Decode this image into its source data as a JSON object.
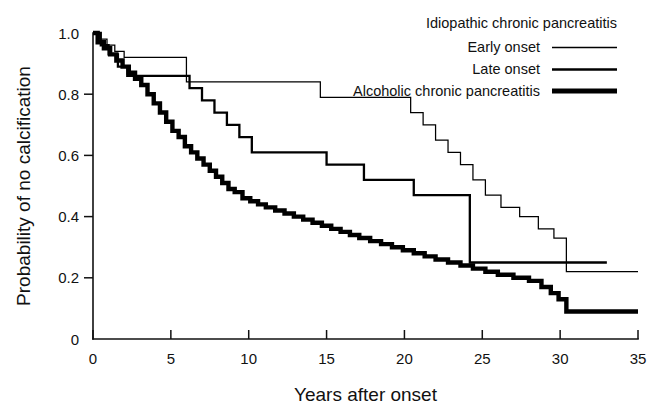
{
  "chart_data": {
    "type": "line",
    "title": "",
    "subtitle": "",
    "xlabel": "Years after onset",
    "ylabel": "Probability of no calcification",
    "xlim": [
      0,
      35
    ],
    "ylim": [
      0,
      1.0
    ],
    "xticks": [
      0,
      5,
      10,
      15,
      20,
      25,
      30,
      35
    ],
    "xticklabels": [
      "0",
      "5",
      "10",
      "15",
      "20",
      "25",
      "30",
      "35"
    ],
    "yticks": [
      0,
      0.2,
      0.4,
      0.6,
      0.8,
      1.0
    ],
    "yticklabels": [
      "0",
      "0.2",
      "0.4",
      "0.6",
      "0.8",
      "1.0"
    ],
    "grid": false,
    "legend_position": "top-right",
    "step_type": "post",
    "annotations": [
      "Kaplan-Meier curves of probability of remaining free of pancreatic calcification"
    ],
    "series": [
      {
        "name": "Early onset",
        "group": "Idiopathic chronic pancreatitis",
        "style": "thin",
        "linewidth": 1.25,
        "color": "#000000",
        "x": [
          0.0,
          0.4,
          0.9,
          1.4,
          2.0,
          5.2,
          6.0,
          13.8,
          14.6,
          19.6,
          20.4,
          21.2,
          22.0,
          22.8,
          23.6,
          24.4,
          25.2,
          26.2,
          27.4,
          28.6,
          29.6,
          30.4,
          35.0
        ],
        "y": [
          1.0,
          0.98,
          0.96,
          0.94,
          0.92,
          0.92,
          0.84,
          0.84,
          0.79,
          0.79,
          0.74,
          0.7,
          0.65,
          0.61,
          0.57,
          0.52,
          0.47,
          0.43,
          0.4,
          0.36,
          0.33,
          0.22,
          0.22
        ]
      },
      {
        "name": "Late onset",
        "group": "Idiopathic chronic pancreatitis",
        "style": "medium",
        "linewidth": 2.3,
        "color": "#000000",
        "x": [
          0.0,
          0.5,
          1.0,
          1.6,
          2.2,
          5.6,
          6.2,
          7.0,
          7.8,
          8.6,
          9.4,
          10.2,
          14.2,
          15.0,
          16.6,
          17.4,
          19.8,
          20.6,
          23.4,
          24.2,
          33.0
        ],
        "y": [
          1.0,
          0.96,
          0.93,
          0.89,
          0.86,
          0.86,
          0.82,
          0.78,
          0.74,
          0.7,
          0.66,
          0.61,
          0.61,
          0.57,
          0.57,
          0.52,
          0.52,
          0.47,
          0.47,
          0.25,
          0.25
        ]
      },
      {
        "name": "Alcoholic chronic pancreatitis",
        "group": "Alcoholic chronic pancreatitis",
        "style": "thick",
        "linewidth": 4.4,
        "color": "#000000",
        "x": [
          0.0,
          0.3,
          0.7,
          1.1,
          1.5,
          1.9,
          2.3,
          2.7,
          3.1,
          3.5,
          3.9,
          4.3,
          4.7,
          5.1,
          5.5,
          5.9,
          6.3,
          6.7,
          7.1,
          7.5,
          7.9,
          8.3,
          8.7,
          9.1,
          9.6,
          10.1,
          10.6,
          11.1,
          11.7,
          12.3,
          12.9,
          13.5,
          14.1,
          14.7,
          15.3,
          15.9,
          16.5,
          17.1,
          17.8,
          18.5,
          19.2,
          19.9,
          20.6,
          21.3,
          22.0,
          22.8,
          23.6,
          24.4,
          25.2,
          26.0,
          27.0,
          28.0,
          28.8,
          29.4,
          29.9,
          30.4,
          35.0
        ],
        "y": [
          1.0,
          0.97,
          0.95,
          0.93,
          0.91,
          0.89,
          0.87,
          0.85,
          0.83,
          0.8,
          0.77,
          0.74,
          0.71,
          0.68,
          0.66,
          0.63,
          0.61,
          0.59,
          0.57,
          0.55,
          0.53,
          0.51,
          0.49,
          0.48,
          0.46,
          0.45,
          0.44,
          0.43,
          0.42,
          0.41,
          0.4,
          0.39,
          0.38,
          0.37,
          0.36,
          0.35,
          0.34,
          0.33,
          0.32,
          0.31,
          0.3,
          0.29,
          0.28,
          0.27,
          0.26,
          0.25,
          0.24,
          0.23,
          0.22,
          0.21,
          0.2,
          0.19,
          0.17,
          0.15,
          0.13,
          0.09,
          0.09
        ]
      }
    ]
  },
  "legend": {
    "group_heading": "Idiopathic chronic pancreatitis",
    "entries": [
      {
        "label": "Early onset",
        "style": "thin"
      },
      {
        "label": "Late onset",
        "style": "medium"
      },
      {
        "label": "Alcoholic chronic pancreatitis",
        "style": "thick"
      }
    ]
  }
}
